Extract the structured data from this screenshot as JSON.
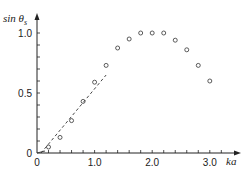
{
  "chart_data": {
    "type": "scatter",
    "title": "",
    "xlabel": "ka",
    "ylabel": "sin θs",
    "ylabel_main": "sin θ",
    "ylabel_sub": "s",
    "xlim": [
      0,
      3.4
    ],
    "ylim": [
      0,
      1.1
    ],
    "x_ticks_labeled": [
      {
        "value": 0,
        "label": "0"
      },
      {
        "value": 1.0,
        "label": "1.0"
      },
      {
        "value": 2.0,
        "label": "2.0"
      },
      {
        "value": 3.0,
        "label": "3.0"
      }
    ],
    "y_ticks_labeled": [
      {
        "value": 0,
        "label": "0"
      },
      {
        "value": 0.5,
        "label": "0.5"
      },
      {
        "value": 1.0,
        "label": "1.0"
      }
    ],
    "x_minor_step": 0.2,
    "y_minor_step": 0.1,
    "grid": false,
    "series": [
      {
        "name": "measured",
        "marker": "open-circle",
        "x": [
          0.2,
          0.4,
          0.6,
          0.8,
          1.0,
          1.2,
          1.4,
          1.6,
          1.8,
          2.0,
          2.2,
          2.4,
          2.6,
          2.8,
          3.0
        ],
        "y": [
          0.05,
          0.13,
          0.27,
          0.43,
          0.59,
          0.73,
          0.875,
          0.95,
          1.0,
          1.0,
          1.0,
          0.94,
          0.86,
          0.73,
          0.6
        ]
      },
      {
        "name": "linear-fit",
        "style": "dashed",
        "x": [
          0.07,
          1.2
        ],
        "y": [
          0.0,
          0.65
        ]
      }
    ]
  }
}
